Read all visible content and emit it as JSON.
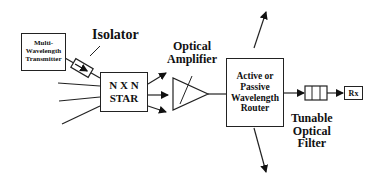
{
  "diagram": {
    "transmitter": {
      "line1": "Multi-",
      "line2": "Wavelength",
      "line3": "Transmitter"
    },
    "isolator": "Isolator",
    "star": {
      "line1": "N X N",
      "line2": "STAR"
    },
    "amplifier": {
      "line1": "Optical",
      "line2": "Amplifier"
    },
    "router": {
      "line1": "Active or",
      "line2": "Passive",
      "line3": "Wavelength",
      "line4": "Router"
    },
    "filter": {
      "line1": "Tunable",
      "line2": "Optical",
      "line3": "Filter"
    },
    "receiver": "Rx"
  }
}
